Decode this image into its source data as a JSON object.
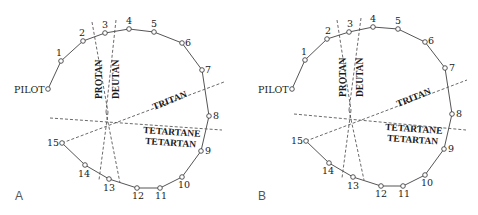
{
  "figure": {
    "panels": [
      {
        "id": "A",
        "label": "A",
        "pilot_label": "PILOT",
        "caps": [
          "1",
          "2",
          "3",
          "4",
          "5",
          "6",
          "7",
          "8",
          "9",
          "10",
          "11",
          "12",
          "13",
          "14",
          "15"
        ],
        "axes": [
          "PROTAN",
          "DEUTAN",
          "TRITAN",
          "TETARTANE",
          "TETARTAN"
        ]
      },
      {
        "id": "B",
        "label": "B",
        "pilot_label": "PILOT",
        "caps": [
          "1",
          "2",
          "3",
          "4",
          "5",
          "6",
          "7",
          "8",
          "9",
          "10",
          "11",
          "12",
          "13",
          "14",
          "15"
        ],
        "axes": [
          "PROTAN",
          "DEUTAN",
          "TRITAN",
          "TETARTANE",
          "TETARTAN"
        ]
      }
    ]
  },
  "panelA": {
    "label": "A",
    "pilot": "PILOT",
    "c1": "1",
    "c2": "2",
    "c3": "3",
    "c4": "4",
    "c5": "5",
    "c6": "6",
    "c7": "7",
    "c8": "8",
    "c9": "9",
    "c10": "10",
    "c11": "11",
    "c12": "12",
    "c13": "13",
    "c14": "14",
    "c15": "15",
    "protan": "PROTAN",
    "deutan": "DEUTAN",
    "tritan": "TRITAN",
    "tetartane": "TETARTANE",
    "tetartan": "TETARTAN"
  },
  "panelB": {
    "label": "B",
    "pilot": "PILOT",
    "c1": "1",
    "c2": "2",
    "c3": "3",
    "c4": "4",
    "c5": "5",
    "c6": "6",
    "c7": "7",
    "c8": "8",
    "c9": "9",
    "c10": "10",
    "c11": "11",
    "c12": "12",
    "c13": "13",
    "c14": "14",
    "c15": "15",
    "protan": "PROTAN",
    "deutan": "DEUTAN",
    "tritan": "TRITAN",
    "tetartane": "TETARTANE",
    "tetartan": "TETARTAN"
  }
}
